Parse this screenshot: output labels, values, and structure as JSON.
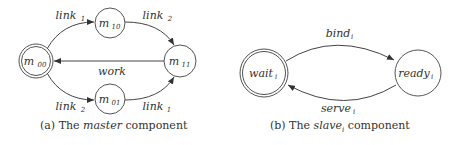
{
  "master": {
    "caption_prefix": "(a) The",
    "caption_name": "master",
    "caption_suffix": "component",
    "states": [
      {
        "id": "m00",
        "base": "m",
        "sub": "00",
        "initial": true
      },
      {
        "id": "m10",
        "base": "m",
        "sub": "10",
        "initial": false
      },
      {
        "id": "m01",
        "base": "m",
        "sub": "01",
        "initial": false
      },
      {
        "id": "m11",
        "base": "m",
        "sub": "11",
        "initial": false
      }
    ],
    "transitions": [
      {
        "from": "m00",
        "to": "m10",
        "label": "link",
        "sub": "1"
      },
      {
        "from": "m10",
        "to": "m11",
        "label": "link",
        "sub": "2"
      },
      {
        "from": "m11",
        "to": "m00",
        "label": "work",
        "sub": ""
      },
      {
        "from": "m00",
        "to": "m01",
        "label": "link",
        "sub": "2"
      },
      {
        "from": "m01",
        "to": "m11",
        "label": "link",
        "sub": "1"
      }
    ]
  },
  "slave": {
    "caption_prefix": "(b) The",
    "caption_name": "slave",
    "caption_name_sub": "i",
    "caption_suffix": "component",
    "states": [
      {
        "id": "wait",
        "base": "wait",
        "sub": "i",
        "initial": true
      },
      {
        "id": "ready",
        "base": "ready",
        "sub": "i",
        "initial": false
      }
    ],
    "transitions": [
      {
        "from": "wait",
        "to": "ready",
        "label": "bind",
        "sub": "i"
      },
      {
        "from": "ready",
        "to": "wait",
        "label": "serve",
        "sub": "i"
      }
    ]
  }
}
